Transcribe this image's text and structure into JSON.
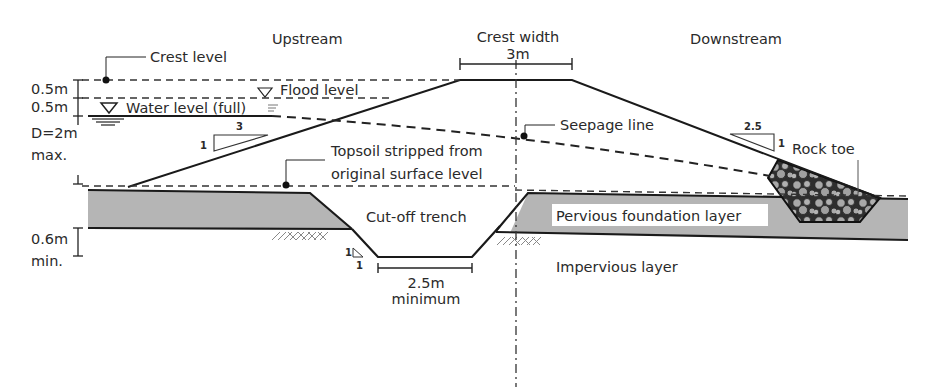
{
  "diagram": {
    "regions": {
      "upstream": "Upstream",
      "downstream": "Downstream"
    },
    "crest": {
      "label": "Crest width",
      "value": "3m"
    },
    "labels": {
      "crest_level": "Crest level",
      "flood_level": "Flood level",
      "water_level": "Water level (full)",
      "seepage_line": "Seepage line",
      "topsoil_line1": "Topsoil stripped from",
      "topsoil_line2": "original surface level",
      "rock_toe": "Rock toe",
      "cutoff_trench": "Cut-off trench",
      "pervious_layer": "Pervious foundation layer",
      "impervious_layer": "Impervious layer"
    },
    "dimensions": {
      "freeboard_top": "0.5m",
      "freeboard_bottom": "0.5m",
      "depth_line1": "D=2m",
      "depth_line2": "max.",
      "foundation_line1": "0.6m",
      "foundation_line2": "min.",
      "trench_width_line1": "2.5m",
      "trench_width_line2": "minimum"
    },
    "slopes": {
      "upstream_run": "3",
      "upstream_rise": "1",
      "downstream_run": "2.5",
      "downstream_rise": "1",
      "trench_run": "1",
      "trench_rise": "1"
    },
    "colors": {
      "foundation_fill": "#b3b3b3",
      "rock_fill": "#3a3a3a",
      "rock_stone": "#a8a8a8",
      "line": "#1a1a1a"
    }
  }
}
